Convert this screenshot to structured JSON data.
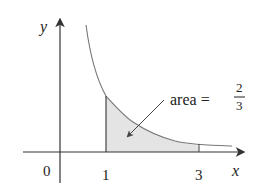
{
  "diagram": {
    "function": "y = 1/x^2",
    "axes": {
      "x_label": "x",
      "y_label": "y",
      "origin_label": "0"
    },
    "ticks": [
      {
        "value": 1,
        "label": "1"
      },
      {
        "value": 3,
        "label": "3"
      }
    ],
    "shaded_region": {
      "from": 1,
      "to": 3
    },
    "annotation": {
      "prefix": "area =",
      "numerator": "2",
      "denominator": "3"
    },
    "colors": {
      "axis": "#333333",
      "curve": "#777777",
      "fill": "#e4e4e4",
      "text": "#222222"
    }
  }
}
